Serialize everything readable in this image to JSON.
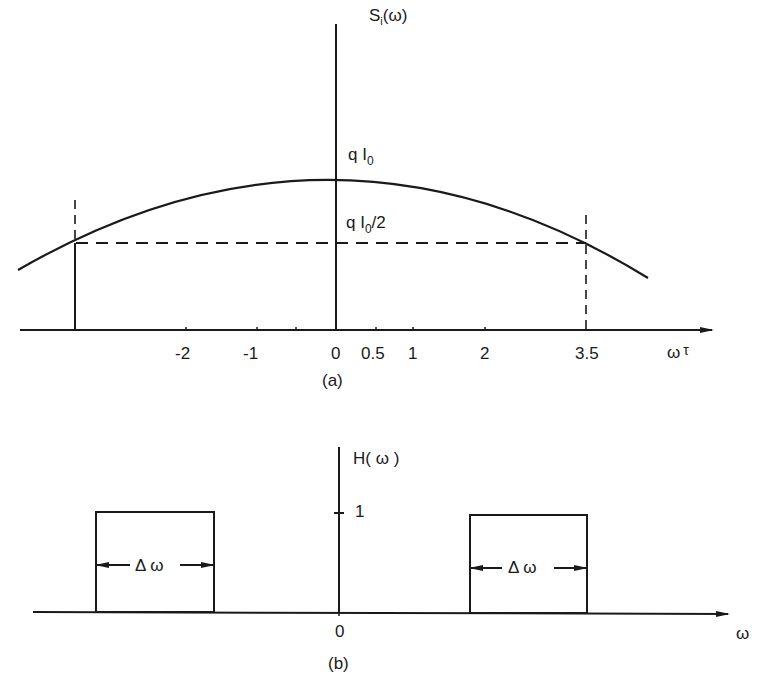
{
  "figure_a": {
    "y_label_main": "S",
    "y_label_sub": "i",
    "y_label_arg": "(ω)",
    "peak_label_main": "q I",
    "peak_label_sub": "0",
    "half_label_main": "q I",
    "half_label_sub": "0",
    "half_label_rest": "/2",
    "x_axis_label_main": "ω",
    "x_axis_label_sup": "τ",
    "ticks": [
      "-2",
      "-1",
      "0",
      "0.5",
      "1",
      "2",
      "3.5"
    ],
    "caption": "(a)"
  },
  "figure_b": {
    "y_label": "H( ω )",
    "y_tick": "1",
    "origin_label": "0",
    "x_axis_label": "ω",
    "left_band_label": "Δ ω",
    "right_band_label": "Δ ω",
    "caption": "(b)"
  },
  "colors": {
    "ink": "#1a1a1a",
    "background": "#ffffff"
  }
}
